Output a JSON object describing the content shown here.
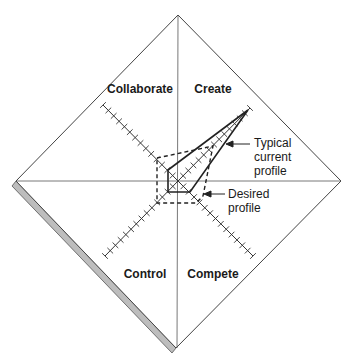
{
  "diagram": {
    "type": "four-quadrant diamond radar",
    "quadrants": [
      {
        "id": "collaborate",
        "label": "Collaborate",
        "position": "upper-left"
      },
      {
        "id": "create",
        "label": "Create",
        "position": "upper-right"
      },
      {
        "id": "control",
        "label": "Control",
        "position": "lower-left"
      },
      {
        "id": "compete",
        "label": "Compete",
        "position": "lower-right"
      }
    ],
    "axes": {
      "count": 4,
      "ticks_per_axis": 14
    },
    "profiles": [
      {
        "id": "current",
        "label_lines": [
          "Typical",
          "current",
          "profile"
        ],
        "style": "solid"
      },
      {
        "id": "desired",
        "label_lines": [
          "Desired",
          "profile"
        ],
        "style": "dashed"
      }
    ],
    "colors": {
      "line": "#2a2a2a",
      "thin_line": "#555555",
      "shadow": "#b8b8b8",
      "background": "#ffffff"
    }
  }
}
